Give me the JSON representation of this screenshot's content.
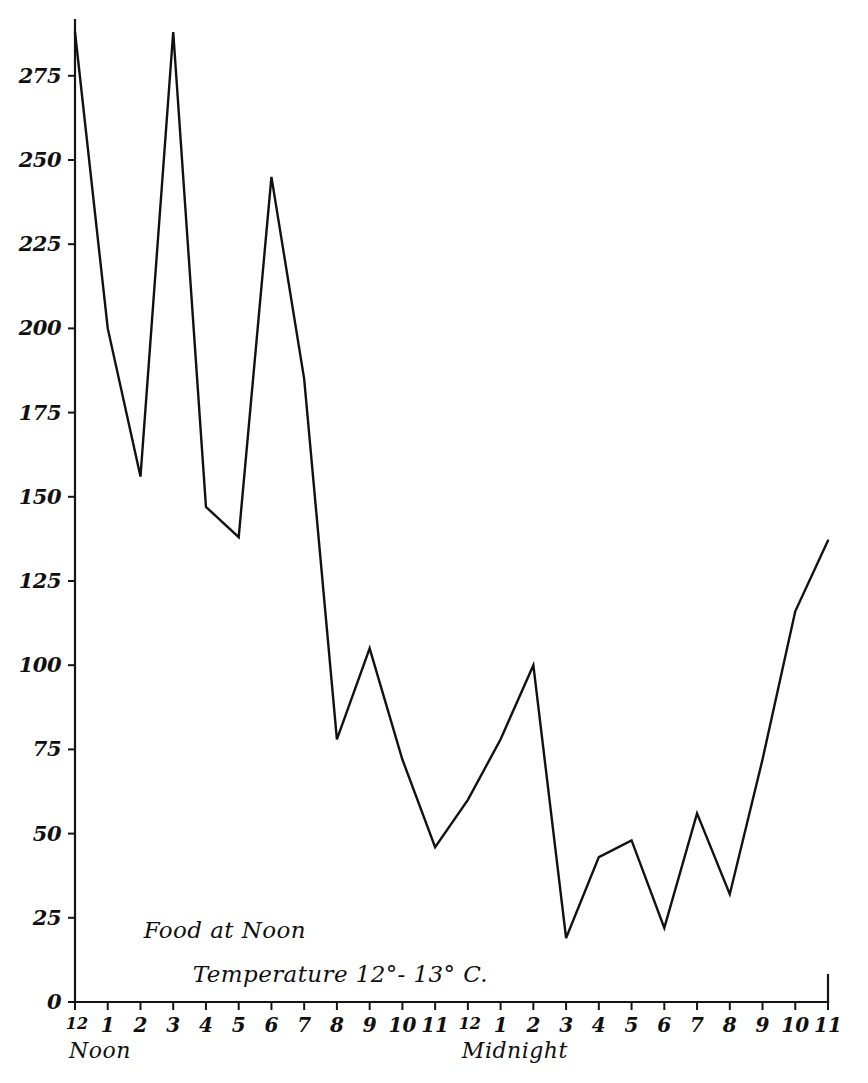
{
  "chart_data": {
    "type": "line",
    "title": "",
    "xlabel": "",
    "ylabel": "",
    "ylim": [
      0,
      290
    ],
    "xlim": [
      0,
      23
    ],
    "grid": false,
    "legend": null,
    "series": [
      {
        "name": "activity",
        "values": [
          288,
          200,
          156,
          288,
          147,
          138,
          245,
          185,
          78,
          105,
          72,
          46,
          60,
          78,
          100,
          19,
          43,
          48,
          22,
          56,
          32,
          72,
          116,
          137
        ]
      }
    ],
    "x": [
      0,
      1,
      2,
      3,
      4,
      5,
      6,
      7,
      8,
      9,
      10,
      11,
      12,
      13,
      14,
      15,
      16,
      17,
      18,
      19,
      20,
      21,
      22,
      23
    ],
    "x_tick_labels": [
      "12",
      "1",
      "2",
      "3",
      "4",
      "5",
      "6",
      "7",
      "8",
      "9",
      "10",
      "11",
      "12",
      "1",
      "2",
      "3",
      "4",
      "5",
      "6",
      "7",
      "8",
      "9",
      "10",
      "11"
    ],
    "y_tick_labels": [
      "0",
      "25",
      "50",
      "75",
      "100",
      "125",
      "150",
      "175",
      "200",
      "225",
      "250",
      "275"
    ],
    "y_tick_values": [
      0,
      25,
      50,
      75,
      100,
      125,
      150,
      175,
      200,
      225,
      250,
      275
    ],
    "period_labels": [
      {
        "text": "Noon",
        "x_index": 0
      },
      {
        "text": "Midnight",
        "x_index": 12
      }
    ],
    "annotations": [
      {
        "text": "Food at Noon",
        "x_index": 2.1,
        "y_value": 19
      },
      {
        "text": "Temperature 12°- 13° C.",
        "x_index": 3.6,
        "y_value": 6
      }
    ],
    "colors": {
      "line": "#111111",
      "axis": "#141414",
      "background": "#ffffff",
      "text": "#101010"
    }
  }
}
